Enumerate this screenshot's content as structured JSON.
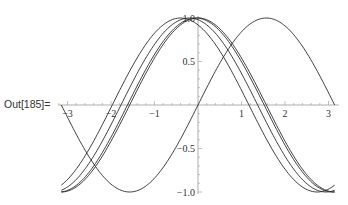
{
  "cell": {
    "output_label": "Out[185]="
  },
  "chart_data": {
    "type": "line",
    "title": "",
    "xlabel": "",
    "ylabel": "",
    "xlim": [
      -3.14159,
      3.14159
    ],
    "ylim": [
      -1.0,
      1.0
    ],
    "grid": false,
    "legend": null,
    "x_ticks": [
      {
        "value": -3,
        "label": "−3"
      },
      {
        "value": -2,
        "label": "−2"
      },
      {
        "value": -1,
        "label": "−1"
      },
      {
        "value": 1,
        "label": "1"
      },
      {
        "value": 2,
        "label": "2"
      },
      {
        "value": 3,
        "label": "3"
      }
    ],
    "y_ticks": [
      {
        "value": 1.0,
        "label": "1.0"
      },
      {
        "value": 0.5,
        "label": "0.5"
      },
      {
        "value": -0.5,
        "label": "−0.5"
      },
      {
        "value": -1.0,
        "label": "−1.0"
      }
    ],
    "series": [
      {
        "name": "sin(x)",
        "function": "sin",
        "phase": 0
      },
      {
        "name": "cos(x)",
        "function": "cos",
        "phase": 0
      },
      {
        "name": "cos(x+0.05)",
        "function": "cos",
        "phase": 0.05
      },
      {
        "name": "cos(x+0.2)",
        "function": "cos",
        "phase": 0.2
      },
      {
        "name": "cos(x+0.4)",
        "function": "cos",
        "phase": 0.4
      }
    ],
    "samples": {
      "x": [
        -3.1416,
        -2.8798,
        -2.618,
        -2.3562,
        -2.0944,
        -1.8326,
        -1.5708,
        -1.309,
        -1.0472,
        -0.7854,
        -0.5236,
        -0.2618,
        0,
        0.2618,
        0.5236,
        0.7854,
        1.0472,
        1.309,
        1.5708,
        1.8326,
        2.0944,
        2.3562,
        2.618,
        2.8798,
        3.1416
      ],
      "sin": [
        0,
        -0.259,
        -0.5,
        -0.707,
        -0.866,
        -0.966,
        -1,
        -0.966,
        -0.866,
        -0.707,
        -0.5,
        -0.259,
        0,
        0.259,
        0.5,
        0.707,
        0.866,
        0.966,
        1,
        0.966,
        0.866,
        0.707,
        0.5,
        0.259,
        0
      ],
      "cos": [
        -1,
        -0.966,
        -0.866,
        -0.707,
        -0.5,
        -0.259,
        0,
        0.259,
        0.5,
        0.707,
        0.866,
        0.966,
        1,
        0.966,
        0.866,
        0.707,
        0.5,
        0.259,
        0,
        -0.259,
        -0.5,
        -0.707,
        -0.866,
        -0.966,
        -1
      ]
    },
    "colors": {
      "axis": "#9a9a9a",
      "curve": "#2b2b2b",
      "text": "#333333"
    }
  }
}
